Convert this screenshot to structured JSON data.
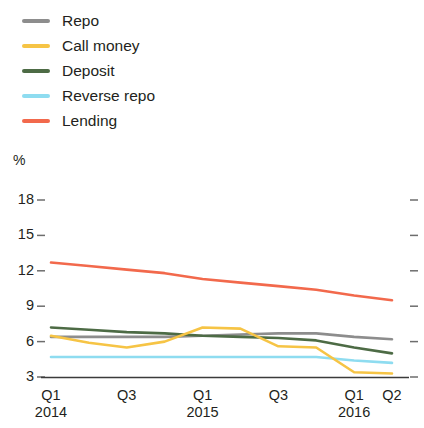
{
  "chart_data": {
    "type": "line",
    "title": "",
    "xlabel": "",
    "ylabel": "%",
    "ylim": [
      3,
      18
    ],
    "yticks": [
      18,
      15,
      12,
      9,
      6,
      3
    ],
    "grid": false,
    "legend_position": "top-left",
    "x": [
      "Q1 2014",
      "Q2 2014",
      "Q3 2014",
      "Q4 2014",
      "Q1 2015",
      "Q2 2015",
      "Q3 2015",
      "Q4 2015",
      "Q1 2016",
      "Q2 2016"
    ],
    "xtick_labels": [
      {
        "quarter": "Q1",
        "year": "2014"
      },
      {
        "quarter": "Q3",
        "year": ""
      },
      {
        "quarter": "Q1",
        "year": "2015"
      },
      {
        "quarter": "Q3",
        "year": ""
      },
      {
        "quarter": "Q1",
        "year": "2016"
      },
      {
        "quarter": "Q2",
        "year": ""
      }
    ],
    "series": [
      {
        "name": "Repo",
        "color": "#8d8d8d",
        "values": [
          6.4,
          6.4,
          6.4,
          6.4,
          6.5,
          6.6,
          6.7,
          6.7,
          6.4,
          6.2
        ]
      },
      {
        "name": "Call money",
        "color": "#f6c445",
        "values": [
          6.5,
          5.9,
          5.5,
          6.0,
          7.2,
          7.1,
          5.6,
          5.5,
          3.4,
          3.3
        ]
      },
      {
        "name": "Deposit",
        "color": "#4d6b45",
        "values": [
          7.2,
          7.0,
          6.8,
          6.7,
          6.5,
          6.4,
          6.3,
          6.1,
          5.5,
          5.0
        ]
      },
      {
        "name": "Reverse repo",
        "color": "#8edcf0",
        "values": [
          4.7,
          4.7,
          4.7,
          4.7,
          4.7,
          4.7,
          4.7,
          4.7,
          4.4,
          4.2
        ]
      },
      {
        "name": "Lending",
        "color": "#f2694c",
        "values": [
          12.7,
          12.4,
          12.1,
          11.8,
          11.3,
          11.0,
          10.7,
          10.4,
          9.9,
          9.5
        ]
      }
    ]
  },
  "legend": {
    "items": [
      {
        "label": "Repo"
      },
      {
        "label": "Call money"
      },
      {
        "label": "Deposit"
      },
      {
        "label": "Reverse repo"
      },
      {
        "label": "Lending"
      }
    ]
  },
  "axis": {
    "unit": "%",
    "y_labels": [
      "18",
      "15",
      "12",
      "9",
      "6",
      "3"
    ],
    "x_labels": [
      {
        "quarter": "Q1",
        "year": "2014"
      },
      {
        "quarter": "Q3",
        "year": ""
      },
      {
        "quarter": "Q1",
        "year": "2015"
      },
      {
        "quarter": "Q3",
        "year": ""
      },
      {
        "quarter": "Q1",
        "year": "2016"
      },
      {
        "quarter": "Q2",
        "year": ""
      }
    ]
  }
}
